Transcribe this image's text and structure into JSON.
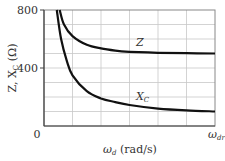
{
  "chart_data": {
    "type": "line",
    "title": "",
    "xlabel": "ωd (rad/s)",
    "ylabel": "Z, XC (Ω)",
    "x_tick_labels": [
      "0",
      "ωdr"
    ],
    "y_tick_labels": [
      "400",
      "800"
    ],
    "ylim": [
      0,
      800
    ],
    "xlim": [
      0,
      6
    ],
    "grid": true,
    "grid_x_divisions": 6,
    "grid_y_step": 100,
    "legend": "inline curve labels",
    "series": [
      {
        "name": "Z",
        "label": "Z",
        "x": [
          0.55,
          0.7,
          1.0,
          1.5,
          2.0,
          2.5,
          3.0,
          4.0,
          5.0,
          6.0
        ],
        "values": [
          800,
          700,
          620,
          560,
          535,
          520,
          512,
          505,
          502,
          500
        ]
      },
      {
        "name": "XC",
        "label": "XC",
        "x": [
          0.45,
          0.6,
          0.8,
          1.0,
          1.5,
          2.0,
          2.5,
          3.0,
          4.0,
          5.0,
          6.0
        ],
        "values": [
          800,
          600,
          450,
          350,
          240,
          190,
          165,
          145,
          120,
          108,
          100
        ]
      }
    ]
  },
  "axes": {
    "y_label_main": "Z, X",
    "y_label_sub": "C",
    "y_label_unit": " (Ω)",
    "y_tick_800": "800",
    "y_tick_400": "400",
    "x_origin": "0",
    "x_end_main": "ω",
    "x_end_sub": "dr",
    "x_label_main": "ω",
    "x_label_sub": "d",
    "x_label_unit": " (rad/s)"
  },
  "curve_labels": {
    "z": "Z",
    "xc_main": "X",
    "xc_sub": "C"
  }
}
